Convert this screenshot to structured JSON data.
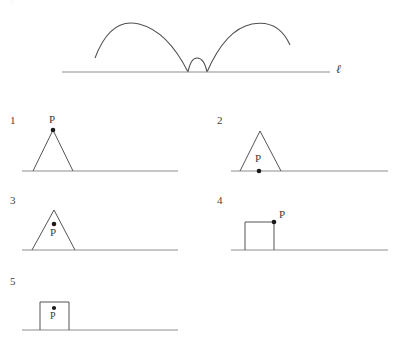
{
  "figure": {
    "line_label": "ℓ",
    "point_label": "P",
    "line_color": "#8e8e8e",
    "shape_color": "#4a4a4a",
    "curve_color": "#4f4f4f",
    "dot_color": "#1a1a1a",
    "background": "#ffffff"
  },
  "clipped_header": {
    "text": "· · | · · · ·   · ·"
  },
  "top_diagram": {
    "name": "traced-path-of-P",
    "line_label": "ℓ",
    "description": "cycloid-like trace: large arch, small arch, large arch",
    "arches": [
      {
        "kind": "large-arch",
        "x_start": 95,
        "x_end": 188,
        "peak_x": 139,
        "peak_y": 24
      },
      {
        "kind": "small-arch",
        "x_start": 188,
        "x_end": 207,
        "peak_x": 197,
        "peak_y": 58
      },
      {
        "kind": "large-arch",
        "x_start": 207,
        "x_end": 290,
        "peak_x": 252,
        "peak_y": 24
      }
    ],
    "baseline": {
      "x_start": 62,
      "x_end": 330,
      "y": 72
    },
    "label_x": 336,
    "label_y": 66
  },
  "options": [
    {
      "number": "1",
      "shape": "triangle",
      "point_position": "apex",
      "number_label_x": 10,
      "number_label_y": 116,
      "baseline": {
        "x_start": 22,
        "x_end": 178,
        "y": 171
      },
      "line_label_x": 184,
      "line_label_y": 165,
      "triangle": {
        "left_x": 33,
        "right_x": 73,
        "apex_x": 53,
        "apex_y": 130
      },
      "dot": {
        "x": 53,
        "y": 130
      },
      "p_label_x": 49,
      "p_label_y": 116
    },
    {
      "number": "2",
      "shape": "triangle",
      "point_position": "base-midpoint",
      "number_label_x": 217,
      "number_label_y": 116,
      "baseline": {
        "x_start": 231,
        "x_end": 388,
        "y": 171
      },
      "line_label_x": 394,
      "line_label_y": 165,
      "triangle": {
        "left_x": 240,
        "right_x": 281,
        "apex_x": 260,
        "apex_y": 131
      },
      "dot": {
        "x": 259,
        "y": 171
      },
      "p_label_x": 255,
      "p_label_y": 156
    },
    {
      "number": "3",
      "shape": "triangle",
      "point_position": "interior-upper",
      "number_label_x": 10,
      "number_label_y": 196,
      "baseline": {
        "x_start": 22,
        "x_end": 178,
        "y": 250
      },
      "line_label_x": 184,
      "line_label_y": 244,
      "triangle": {
        "left_x": 32,
        "right_x": 75,
        "apex_x": 54,
        "apex_y": 210
      },
      "dot": {
        "x": 54,
        "y": 224
      },
      "p_label_x": 50,
      "p_label_y": 229
    },
    {
      "number": "4",
      "shape": "square",
      "point_position": "top-right-corner",
      "number_label_x": 217,
      "number_label_y": 196,
      "baseline": {
        "x_start": 231,
        "x_end": 388,
        "y": 250
      },
      "line_label_x": 394,
      "line_label_y": 244,
      "square": {
        "left_x": 245,
        "right_x": 274,
        "top_y": 222
      },
      "dot": {
        "x": 274,
        "y": 222
      },
      "p_label_x": 278,
      "p_label_y": 212
    },
    {
      "number": "5",
      "shape": "square",
      "point_position": "interior-upper",
      "number_label_x": 10,
      "number_label_y": 277,
      "baseline": {
        "x_start": 22,
        "x_end": 178,
        "y": 330
      },
      "line_label_x": 184,
      "line_label_y": 324,
      "square": {
        "left_x": 40,
        "right_x": 69,
        "top_y": 302
      },
      "dot": {
        "x": 54,
        "y": 308
      },
      "p_label_x": 50,
      "p_label_y": 311
    }
  ]
}
